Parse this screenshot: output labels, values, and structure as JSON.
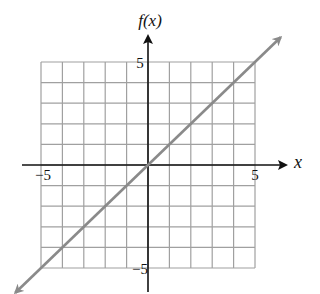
{
  "chart_data": {
    "type": "line",
    "title": "",
    "xlabel": "x",
    "ylabel": "f(x)",
    "xlim": [
      -5,
      5
    ],
    "ylim": [
      -5,
      5
    ],
    "grid": true,
    "grid_step": 1,
    "x_tick_labels": [
      {
        "value": -5,
        "label": "−5"
      },
      {
        "value": 5,
        "label": "5"
      }
    ],
    "y_tick_labels": [
      {
        "value": 5,
        "label": "5"
      },
      {
        "value": -5,
        "label": "−5"
      }
    ],
    "series": [
      {
        "name": "f(x) = x",
        "x": [
          -5,
          0,
          5
        ],
        "values": [
          -5,
          0,
          5
        ],
        "extends_beyond_grid": true,
        "arrows_both_ends": true
      }
    ],
    "colors": {
      "grid": "#a0a0a0",
      "axis": "#111111",
      "line": "#8a8a8a"
    }
  }
}
